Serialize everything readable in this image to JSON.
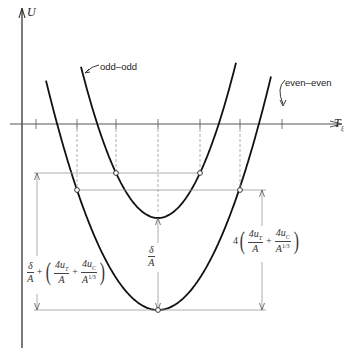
{
  "figure": {
    "y_axis_label": "U",
    "x_axis_label": "T",
    "x_axis_subscript": "ξ",
    "curve_labels": {
      "odd_odd": "odd–odd",
      "even_even": "even–even"
    },
    "annotations": {
      "delta_over_A": {
        "num": "δ",
        "den": "A"
      },
      "left_formula": {
        "prefix_num": "δ",
        "prefix_den": "A",
        "plus": "+",
        "term1_num": "4u",
        "term1_sub": "T",
        "term1_den": "A",
        "term2_num": "4u",
        "term2_sub": "C",
        "term2_den": "A",
        "term2_den_exp": "1/3"
      },
      "right_formula": {
        "coef": "4",
        "term1_num": "4u",
        "term1_sub": "T",
        "term1_den": "A",
        "plus": "+",
        "term2_num": "4u",
        "term2_sub": "C",
        "term2_den": "A",
        "term2_den_exp": "1/3"
      }
    },
    "colors": {
      "curve": "#111111",
      "axis": "#555555",
      "guide": "#999999"
    },
    "geometry": {
      "y_axis_x": 22,
      "x_axis_y": 124,
      "ticks_x": [
        36,
        77,
        116,
        158,
        200,
        240,
        282
      ],
      "odd_odd": {
        "vertex": [
          158,
          218
        ],
        "points": [
          [
            116,
            173
          ],
          [
            200,
            173
          ]
        ]
      },
      "even_even": {
        "vertex": [
          158,
          310
        ],
        "points": [
          [
            77,
            190
          ],
          [
            240,
            190
          ]
        ]
      }
    }
  }
}
